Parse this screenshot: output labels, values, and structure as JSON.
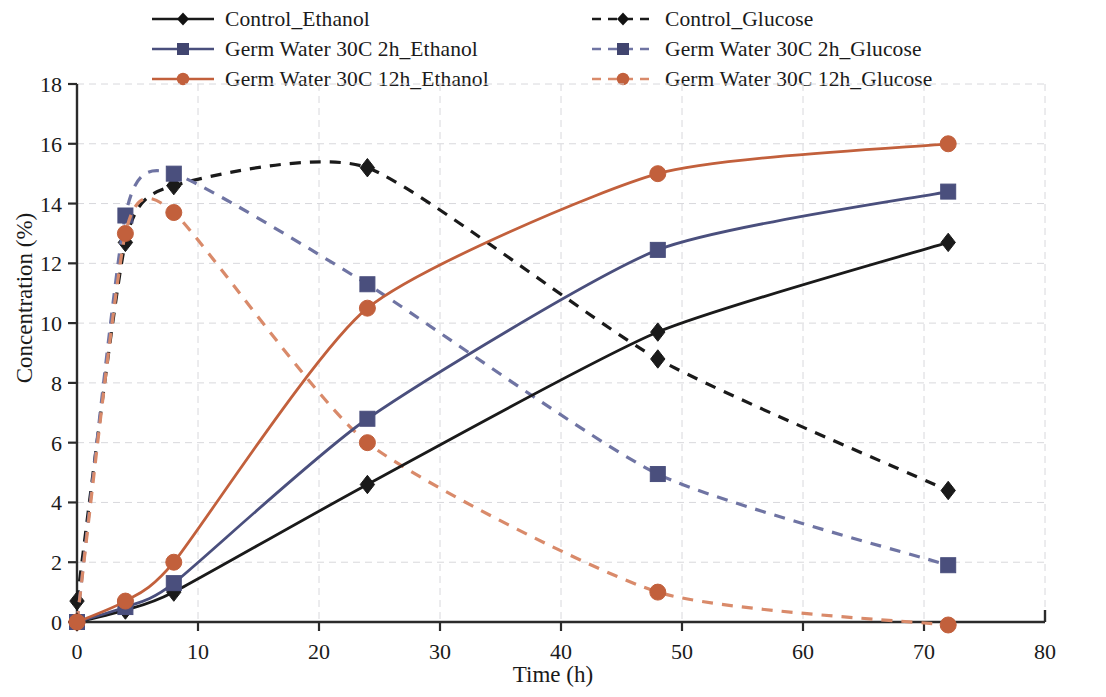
{
  "chart_data": {
    "type": "line",
    "title": "",
    "xlabel": "Time (h)",
    "ylabel": "Concentration (%)",
    "xlim": [
      0,
      80
    ],
    "ylim": [
      0,
      18
    ],
    "xticks": [
      0,
      10,
      20,
      30,
      40,
      50,
      60,
      70,
      80
    ],
    "yticks": [
      0,
      2,
      4,
      6,
      8,
      10,
      12,
      14,
      16,
      18
    ],
    "grid": "dashed-light-both-axes",
    "legend_position": "top, two columns, outside plot",
    "x": [
      0,
      4,
      8,
      24,
      48,
      72
    ],
    "series": [
      {
        "name": "Control_Ethanol",
        "color": "#1a1a1a",
        "style": "solid",
        "marker": "diamond",
        "values": [
          0.0,
          0.4,
          1.0,
          4.6,
          9.7,
          12.7
        ]
      },
      {
        "name": "Germ Water 30C 2h_Ethanol",
        "color": "#4a4f7d",
        "style": "solid",
        "marker": "square",
        "values": [
          0.0,
          0.5,
          1.3,
          6.8,
          12.45,
          14.4
        ]
      },
      {
        "name": "Germ Water 30C 12h_Ethanol",
        "color": "#c2603c",
        "style": "solid",
        "marker": "circle",
        "values": [
          0.0,
          0.7,
          2.0,
          10.5,
          15.0,
          16.0
        ]
      },
      {
        "name": "Control_Glucose",
        "color": "#1a1a1a",
        "style": "dashed",
        "marker": "diamond",
        "values": [
          0.7,
          12.7,
          14.6,
          15.2,
          8.8,
          4.4
        ]
      },
      {
        "name": "Germ Water 30C 2h_Glucose",
        "color": "#4a4f7d",
        "style": "dashed",
        "marker": "square",
        "values": [
          0.0,
          13.6,
          15.0,
          11.3,
          4.95,
          1.9
        ]
      },
      {
        "name": "Germ Water 30C 12h_Glucose",
        "color": "#c2603c",
        "style": "dashed",
        "marker": "circle",
        "values": [
          0.0,
          13.0,
          13.7,
          6.0,
          1.0,
          -0.1
        ]
      }
    ]
  },
  "legend": {
    "entries": [
      {
        "label": "Control_Ethanol"
      },
      {
        "label": "Control_Glucose"
      },
      {
        "label": "Germ Water 30C 2h_Ethanol"
      },
      {
        "label": "Germ Water 30C 2h_Glucose"
      },
      {
        "label": "Germ Water 30C 12h_Ethanol"
      },
      {
        "label": "Germ Water 30C 12h_Glucose"
      }
    ]
  },
  "axes": {
    "y_title": "Concentration (%)",
    "x_title": "Time (h)",
    "y_tick_labels": [
      "18",
      "16",
      "14",
      "12",
      "10",
      "8",
      "6",
      "4",
      "2",
      "0"
    ],
    "x_tick_labels": [
      "0",
      "10",
      "20",
      "30",
      "40",
      "50",
      "60",
      "70",
      "80"
    ]
  },
  "colors": {
    "control": "#1a1a1a",
    "germ_2h": "#4a4f7d",
    "germ_12h": "#c2603c",
    "grid": "#d8d8dc",
    "axis": "#2b2b2b"
  }
}
